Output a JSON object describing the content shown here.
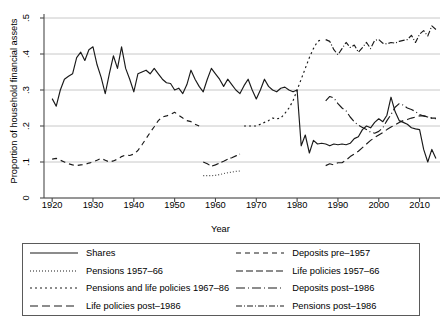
{
  "chart_data": {
    "type": "line",
    "title": "",
    "xlabel": "Year",
    "ylabel": "Proportion of household financial assets",
    "xlim": [
      1918,
      2015
    ],
    "ylim": [
      0,
      0.5
    ],
    "xticks": [
      1920,
      1930,
      1940,
      1950,
      1960,
      1970,
      1980,
      1990,
      2000,
      2010
    ],
    "xticklabels": [
      "1920",
      "1930",
      "1940",
      "1950",
      "1960",
      "1970",
      "1980",
      "1990",
      "2000",
      "2010"
    ],
    "yticks": [
      0,
      0.1,
      0.2,
      0.3,
      0.4,
      0.5
    ],
    "yticklabels": [
      "0",
      ".1",
      ".2",
      ".3",
      ".4",
      ".5"
    ],
    "grid": "horizontal",
    "legend_position": "below-plot",
    "series": [
      {
        "name": "Shares",
        "style": "solid",
        "dash": "none",
        "color": "#1a1a1a",
        "x": [
          1920,
          1921,
          1922,
          1923,
          1924,
          1925,
          1926,
          1927,
          1928,
          1929,
          1930,
          1931,
          1932,
          1933,
          1934,
          1935,
          1936,
          1937,
          1938,
          1939,
          1940,
          1941,
          1942,
          1943,
          1944,
          1945,
          1946,
          1947,
          1948,
          1949,
          1950,
          1951,
          1952,
          1953,
          1954,
          1955,
          1956,
          1957,
          1958,
          1959,
          1960,
          1961,
          1962,
          1963,
          1964,
          1965,
          1966,
          1967,
          1968,
          1969,
          1970,
          1971,
          1972,
          1973,
          1974,
          1975,
          1976,
          1977,
          1978,
          1979,
          1980,
          1981,
          1982,
          1983,
          1984,
          1985,
          1986,
          1987,
          1988,
          1989,
          1990,
          1991,
          1992,
          1993,
          1994,
          1995,
          1996,
          1997,
          1998,
          1999,
          2000,
          2001,
          2002,
          2003,
          2004,
          2005,
          2006,
          2007,
          2008,
          2009,
          2010,
          2011,
          2012,
          2013,
          2014
        ],
        "y": [
          0.276,
          0.255,
          0.3,
          0.33,
          0.338,
          0.345,
          0.39,
          0.405,
          0.382,
          0.412,
          0.42,
          0.37,
          0.335,
          0.29,
          0.345,
          0.395,
          0.36,
          0.42,
          0.36,
          0.33,
          0.295,
          0.345,
          0.35,
          0.355,
          0.345,
          0.36,
          0.345,
          0.33,
          0.32,
          0.318,
          0.3,
          0.305,
          0.29,
          0.315,
          0.355,
          0.33,
          0.31,
          0.295,
          0.33,
          0.36,
          0.345,
          0.33,
          0.31,
          0.33,
          0.315,
          0.3,
          0.29,
          0.312,
          0.33,
          0.3,
          0.275,
          0.3,
          0.33,
          0.31,
          0.3,
          0.295,
          0.305,
          0.308,
          0.3,
          0.295,
          0.3,
          0.145,
          0.175,
          0.125,
          0.16,
          0.15,
          0.152,
          0.15,
          0.145,
          0.15,
          0.148,
          0.15,
          0.148,
          0.152,
          0.165,
          0.17,
          0.19,
          0.2,
          0.195,
          0.21,
          0.22,
          0.212,
          0.23,
          0.28,
          0.24,
          0.215,
          0.21,
          0.205,
          0.195,
          0.192,
          0.19,
          0.135,
          0.1,
          0.135,
          0.11
        ]
      },
      {
        "name": "Pensions 1957–66",
        "style": "fine-dotted",
        "dash": "1 2",
        "color": "#4a4a4a",
        "x": [
          1957,
          1958,
          1959,
          1960,
          1961,
          1962,
          1963,
          1964,
          1965,
          1966
        ],
        "y": [
          0.062,
          0.062,
          0.062,
          0.063,
          0.065,
          0.068,
          0.07,
          0.072,
          0.074,
          0.075
        ]
      },
      {
        "name": "Pensions and life policies 1967–86",
        "style": "dotted",
        "dash": "2 3",
        "color": "#1a1a1a",
        "x": [
          1967,
          1968,
          1969,
          1970,
          1971,
          1972,
          1973,
          1974,
          1975,
          1976,
          1977,
          1978,
          1979,
          1980,
          1981,
          1982,
          1983,
          1984,
          1985,
          1986
        ],
        "y": [
          0.2,
          0.2,
          0.2,
          0.2,
          0.205,
          0.21,
          0.215,
          0.222,
          0.22,
          0.222,
          0.235,
          0.25,
          0.27,
          0.3,
          0.33,
          0.36,
          0.39,
          0.415,
          0.435,
          0.44
        ]
      },
      {
        "name": "Life policies post–1986",
        "style": "dashed-long",
        "dash": "8 4",
        "color": "#1a1a1a",
        "x": [
          1987,
          1988,
          1989,
          1990,
          1991,
          1992,
          1993,
          1994,
          1995,
          1996,
          1997,
          1998,
          1999,
          2000,
          2001,
          2002,
          2003,
          2004,
          2005,
          2006,
          2007,
          2008,
          2009,
          2010,
          2011,
          2012,
          2013,
          2014
        ],
        "y": [
          0.09,
          0.095,
          0.092,
          0.098,
          0.098,
          0.105,
          0.115,
          0.122,
          0.13,
          0.14,
          0.15,
          0.16,
          0.168,
          0.175,
          0.182,
          0.19,
          0.197,
          0.203,
          0.21,
          0.215,
          0.218,
          0.222,
          0.225,
          0.228,
          0.228,
          0.225,
          0.222,
          0.222
        ]
      },
      {
        "name": "Deposits pre–1957",
        "style": "dashed",
        "dash": "5 4",
        "color": "#1a1a1a",
        "x": [
          1920,
          1921,
          1922,
          1923,
          1924,
          1925,
          1926,
          1927,
          1928,
          1929,
          1930,
          1931,
          1932,
          1933,
          1934,
          1935,
          1936,
          1937,
          1938,
          1939,
          1940,
          1941,
          1942,
          1943,
          1944,
          1945,
          1946,
          1947,
          1948,
          1949,
          1950,
          1951,
          1952,
          1953,
          1954,
          1955,
          1956
        ],
        "y": [
          0.108,
          0.11,
          0.105,
          0.1,
          0.095,
          0.092,
          0.09,
          0.092,
          0.093,
          0.097,
          0.1,
          0.105,
          0.11,
          0.105,
          0.1,
          0.103,
          0.108,
          0.115,
          0.12,
          0.118,
          0.122,
          0.132,
          0.148,
          0.165,
          0.182,
          0.198,
          0.215,
          0.225,
          0.228,
          0.232,
          0.238,
          0.23,
          0.222,
          0.215,
          0.212,
          0.205,
          0.2
        ]
      },
      {
        "name": "Life policies 1957–66",
        "style": "dashed-med",
        "dash": "7 3",
        "color": "#1a1a1a",
        "x": [
          1957,
          1958,
          1959,
          1960,
          1961,
          1962,
          1963,
          1964,
          1965,
          1966
        ],
        "y": [
          0.1,
          0.095,
          0.088,
          0.092,
          0.097,
          0.102,
          0.108,
          0.112,
          0.117,
          0.122
        ]
      },
      {
        "name": "Deposits post–1986",
        "style": "dash-dot",
        "dash": "9 3 1 3",
        "color": "#1a1a1a",
        "x": [
          1987,
          1988,
          1989,
          1990,
          1991,
          1992,
          1993,
          1994,
          1995,
          1996,
          1997,
          1998,
          1999,
          2000,
          2001,
          2002,
          2003,
          2004,
          2005,
          2006,
          2007,
          2008,
          2009,
          2010,
          2011,
          2012,
          2013,
          2014
        ],
        "y": [
          0.27,
          0.282,
          0.278,
          0.262,
          0.25,
          0.242,
          0.225,
          0.212,
          0.202,
          0.196,
          0.19,
          0.183,
          0.18,
          0.185,
          0.195,
          0.215,
          0.232,
          0.252,
          0.262,
          0.258,
          0.25,
          0.246,
          0.24,
          0.232,
          0.228,
          0.225,
          0.222,
          0.22
        ]
      },
      {
        "name": "Pensions post–1986",
        "style": "dash-dot-short",
        "dash": "6 2 1 2",
        "color": "#1a1a1a",
        "x": [
          1987,
          1988,
          1989,
          1990,
          1991,
          1992,
          1993,
          1994,
          1995,
          1996,
          1997,
          1998,
          1999,
          2000,
          2001,
          2002,
          2003,
          2004,
          2005,
          2006,
          2007,
          2008,
          2009,
          2010,
          2011,
          2012,
          2013,
          2014
        ],
        "y": [
          0.44,
          0.435,
          0.412,
          0.398,
          0.415,
          0.432,
          0.418,
          0.425,
          0.405,
          0.418,
          0.432,
          0.415,
          0.438,
          0.44,
          0.43,
          0.428,
          0.432,
          0.43,
          0.435,
          0.438,
          0.44,
          0.452,
          0.432,
          0.455,
          0.465,
          0.45,
          0.478,
          0.468
        ]
      }
    ]
  },
  "legend": {
    "items": [
      {
        "label": "Shares",
        "swatch": "solid"
      },
      {
        "label": "Deposits pre–1957",
        "swatch": "dashed"
      },
      {
        "label": "Pensions 1957–66",
        "swatch": "fine-dotted"
      },
      {
        "label": "Life policies 1957–66",
        "swatch": "dashed-med"
      },
      {
        "label": "Pensions and life policies 1967–86",
        "swatch": "dotted"
      },
      {
        "label": "Deposits post–1986",
        "swatch": "dash-dot"
      },
      {
        "label": "Life policies post–1986",
        "swatch": "dashed-long"
      },
      {
        "label": "Pensions post–1986",
        "swatch": "dash-dot-short"
      }
    ]
  },
  "colors": {
    "line": "#1a1a1a",
    "grid": "#c8c8c8",
    "axis": "#4a4a4a",
    "legend_border": "#5a5a5a",
    "background": "#ffffff"
  }
}
